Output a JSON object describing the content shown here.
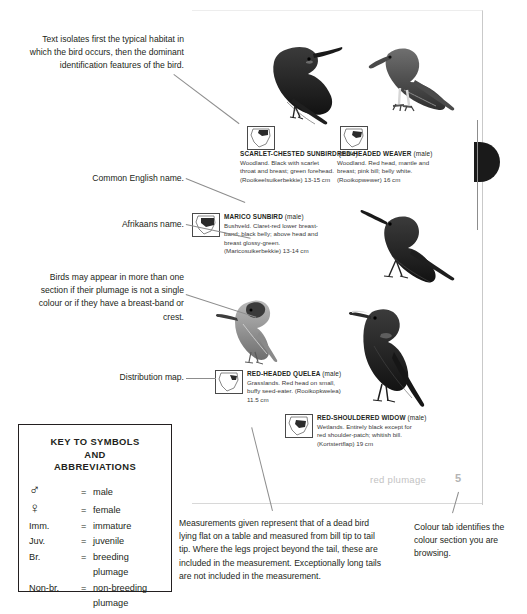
{
  "document": {
    "type": "field-guide-page-annotated",
    "footer": {
      "section_label": "red plumage",
      "page_number": "5"
    }
  },
  "callouts": [
    {
      "id": "text-isolates",
      "text": "Text isolates first the typical habitat in which the bird occurs, then the dominant identification features of the bird."
    },
    {
      "id": "common-name",
      "text": "Common English name."
    },
    {
      "id": "afrikaans-name",
      "text": "Afrikaans name."
    },
    {
      "id": "multi-section",
      "text": "Birds may appear in more than one section if their plumage is not a single colour or if they have a breast-band or crest."
    },
    {
      "id": "distribution-map",
      "text": "Distribution map."
    },
    {
      "id": "measurements",
      "text": "Measurements given represent that of a dead bird lying flat on a table and measured from bill tip to tail tip. Where the legs project beyond the tail, these are included in the measurement. Exceptionally long tails are not included in the measurement."
    },
    {
      "id": "colour-tab",
      "text": "Colour tab identifies the colour section you are browsing."
    }
  ],
  "species": [
    {
      "id": "scarlet-chested-sunbird",
      "name": "SCARLET-CHESTED SUNBIRD",
      "sex": "(male)",
      "habitat": "Woodland.",
      "description": "Black with scarlet throat and breast; green forehead.",
      "afrikaans": "(Rooikeelsuikerbekkie)",
      "size": "13-15 cm"
    },
    {
      "id": "red-headed-weaver",
      "name": "RED-HEADED WEAVER",
      "sex": "(male)",
      "habitat": "Woodland.",
      "description": "Red head, mantle and breast; pink bill; belly white.",
      "afrikaans": "(Rooikopwewer)",
      "size": "16 cm"
    },
    {
      "id": "marico-sunbird",
      "name": "MARICO SUNBIRD",
      "sex": "(male)",
      "habitat": "Bushveld.",
      "description": "Claret-red lower breast-band; black belly; above head and breast glossy-green.",
      "afrikaans": "(Maricosuikerbekkie)",
      "size": "13-14 cm"
    },
    {
      "id": "red-headed-quelea",
      "name": "RED-HEADED QUELEA",
      "sex": "(male)",
      "habitat": "Grasslands.",
      "description": "Red head on small, buffy seed-eater.",
      "afrikaans": "(Rooikopkwelea)",
      "size": "11.5 cm"
    },
    {
      "id": "red-shouldered-widow",
      "name": "RED-SHOULDERED WIDOW",
      "sex": "(male)",
      "habitat": "Wetlands.",
      "description": "Entirely black except for red shoulder-patch; whitish bill.",
      "afrikaans": "(Kortstertflap)",
      "size": "19 cm"
    }
  ],
  "key": {
    "title_line1": "KEY TO SYMBOLS",
    "title_line2": "AND",
    "title_line3": "ABBREVIATIONS",
    "equals": "=",
    "rows": [
      {
        "symbol": "♂",
        "definition": "male",
        "is_glyph": true
      },
      {
        "symbol": "♀",
        "definition": "female",
        "is_glyph": true
      },
      {
        "symbol": "Imm.",
        "definition": "immature",
        "is_glyph": false
      },
      {
        "symbol": "Juv.",
        "definition": "juvenile",
        "is_glyph": false
      },
      {
        "symbol": "Br.",
        "definition": "breeding",
        "definition_cont": "plumage",
        "is_glyph": false
      },
      {
        "symbol": "Non-br.",
        "definition": "non-breeding",
        "definition_cont": "plumage",
        "is_glyph": false
      }
    ]
  },
  "colors": {
    "ink": "#231f20",
    "leader_line": "#8d8d8d",
    "tab": "#1a1a1a",
    "footer_text": "#c3c3c3",
    "page_border": "#c9c9c9"
  }
}
